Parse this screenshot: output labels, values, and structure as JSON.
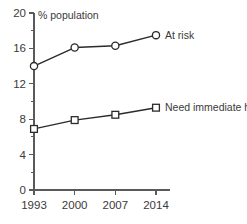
{
  "chart_data": {
    "type": "line",
    "title": "",
    "ylabel": "% population",
    "xlabel": "",
    "categories": [
      "1993",
      "2000",
      "2007",
      "2014"
    ],
    "x": [
      1993,
      2000,
      2007,
      2014
    ],
    "ylim": [
      0,
      20
    ],
    "xlim": [
      1993,
      2014
    ],
    "y_major_ticks": [
      0,
      4,
      8,
      12,
      16,
      20
    ],
    "y_major_tick_labels": [
      "0",
      "4",
      "8",
      "12",
      "16",
      "20"
    ],
    "y_minor_ticks": [
      2,
      6,
      10,
      14,
      18
    ],
    "grid": false,
    "legend_position": "inline-right",
    "series": [
      {
        "name": "At risk",
        "marker": "circle",
        "values": [
          14.0,
          16.1,
          16.3,
          17.5
        ]
      },
      {
        "name": "Need immediate help",
        "marker": "square",
        "values": [
          6.9,
          7.9,
          8.5,
          9.3
        ]
      }
    ],
    "colors": {
      "line": "#2b2b2b",
      "axis": "#5a5a5a",
      "text": "#3a3a3a",
      "background": "#ffffff",
      "marker_fill": "#ffffff"
    }
  }
}
